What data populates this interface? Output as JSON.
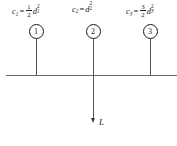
{
  "figure": {
    "baseline": {
      "x": 6,
      "y": 75,
      "width": 171
    },
    "colors": {
      "ink": "#1a1a1a",
      "line": "#6a6a6a",
      "stem": "#555555",
      "background": "#ffffff"
    }
  },
  "nodes": [
    {
      "id": "1",
      "circle_label": "1",
      "x": 36,
      "circle_top": 24,
      "stem_top": 39,
      "stem_bottom": 75,
      "label_x": 12,
      "formula": {
        "lhs_var": "c",
        "lhs_sub": "1",
        "equals": "=",
        "coefficient_type": "fraction",
        "numerator": "1",
        "denominator": "2",
        "rhs_var": "d",
        "rhs_sub": "1",
        "rhs_sup": "2",
        "plain": "c1 = (1/2) d1^2"
      }
    },
    {
      "id": "2",
      "circle_label": "2",
      "x": 93,
      "circle_top": 24,
      "stem_top": 39,
      "stem_bottom": 75,
      "label_x": 72,
      "formula": {
        "lhs_var": "c",
        "lhs_sub": "2",
        "equals": "=",
        "coefficient_type": "none",
        "numerator": "",
        "denominator": "",
        "rhs_var": "d",
        "rhs_sub": "2",
        "rhs_sup": "2",
        "plain": "c2 = d2^2"
      }
    },
    {
      "id": "3",
      "circle_label": "3",
      "x": 150,
      "circle_top": 24,
      "stem_top": 39,
      "stem_bottom": 75,
      "label_x": 126,
      "formula": {
        "lhs_var": "c",
        "lhs_sub": "3",
        "equals": "=",
        "coefficient_type": "fraction",
        "numerator": "3",
        "denominator": "2",
        "rhs_var": "d",
        "rhs_sub": "3",
        "rhs_sup": "2",
        "plain": "c3 = (3/2) d3^2"
      }
    }
  ],
  "load": {
    "label": "L",
    "x": 93,
    "shaft_top": 75,
    "shaft_bottom": 124,
    "label_x": 99,
    "label_y": 120,
    "direction": "down"
  }
}
